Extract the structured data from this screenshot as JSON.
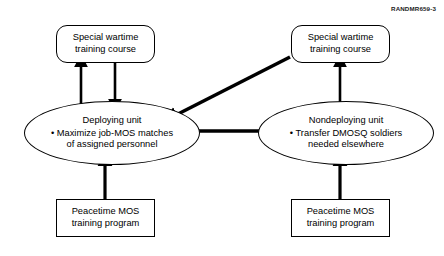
{
  "figure": {
    "source_label": "RANDMR659-3",
    "width": 444,
    "height": 256
  },
  "nodes": {
    "wartime_left": {
      "label": "Special wartime\ntraining course",
      "shape": "rounded-rectangle"
    },
    "wartime_right": {
      "label": "Special wartime\ntraining course",
      "shape": "rounded-rectangle"
    },
    "deploying": {
      "title": "Deploying unit",
      "bullet": "• Maximize job-MOS matches\nof assigned personnel",
      "shape": "ellipse"
    },
    "nondeploying": {
      "title": "Nondeploying unit",
      "bullet": "• Transfer DMOSQ soldiers\nneeded elsewhere",
      "shape": "ellipse"
    },
    "peacetime_left": {
      "label": "Peacetime MOS\ntraining program",
      "shape": "rectangle"
    },
    "peacetime_right": {
      "label": "Peacetime MOS\ntraining program",
      "shape": "rectangle"
    }
  },
  "connectors": [
    {
      "name": "deploying-to-wartime-left",
      "from": "deploying",
      "to": "wartime_left",
      "direction": "up",
      "style": "straight"
    },
    {
      "name": "wartime-left-to-deploying",
      "from": "wartime_left",
      "to": "deploying",
      "direction": "down",
      "style": "straight"
    },
    {
      "name": "nondeploying-to-wartime-right",
      "from": "nondeploying",
      "to": "wartime_right",
      "direction": "up",
      "style": "straight"
    },
    {
      "name": "wartime-right-to-deploying",
      "from": "wartime_right",
      "to": "deploying",
      "direction": "down-left",
      "style": "diagonal"
    },
    {
      "name": "nondeploying-to-deploying",
      "from": "nondeploying",
      "to": "deploying",
      "direction": "left",
      "style": "straight"
    },
    {
      "name": "peacetime-left-to-deploying",
      "from": "peacetime_left",
      "to": "deploying",
      "direction": "up",
      "style": "straight"
    },
    {
      "name": "peacetime-right-to-nondeploying",
      "from": "peacetime_right",
      "to": "nondeploying",
      "direction": "up",
      "style": "straight"
    }
  ],
  "colors": {
    "stroke": "#000000",
    "fill": "#ffffff",
    "text": "#000000"
  }
}
